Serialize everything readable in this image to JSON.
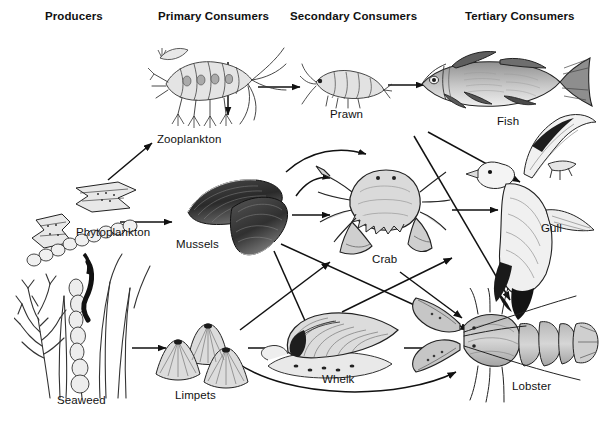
{
  "diagram": {
    "width": 601,
    "height": 433,
    "background_color": "#ffffff",
    "ink_color": "#111111",
    "style": "black and white line engraving illustration"
  },
  "columns": [
    {
      "id": "producers",
      "label": "Producers",
      "x": 45,
      "y": 10
    },
    {
      "id": "primary",
      "label": "Primary Consumers",
      "x": 158,
      "y": 10
    },
    {
      "id": "secondary",
      "label": "Secondary Consumers",
      "x": 290,
      "y": 10
    },
    {
      "id": "tertiary",
      "label": "Tertiary Consumers",
      "x": 465,
      "y": 10
    }
  ],
  "organisms": [
    {
      "id": "phytoplankton",
      "label": "Phytoplankton",
      "trophic_level": "Producers",
      "label_x": 76,
      "label_y": 226,
      "art_x": 18,
      "art_y": 160,
      "art_w": 130,
      "art_h": 110
    },
    {
      "id": "seaweed",
      "label": "Seaweed",
      "trophic_level": "Producers",
      "label_x": 57,
      "label_y": 394,
      "art_x": 16,
      "art_y": 250,
      "art_w": 135,
      "art_h": 150
    },
    {
      "id": "zooplankton",
      "label": "Zooplankton",
      "trophic_level": "Primary Consumers",
      "label_x": 157,
      "label_y": 133,
      "art_x": 150,
      "art_y": 32,
      "art_w": 135,
      "art_h": 100
    },
    {
      "id": "mussels",
      "label": "Mussels",
      "trophic_level": "Primary Consumers",
      "label_x": 176,
      "label_y": 238,
      "art_x": 180,
      "art_y": 168,
      "art_w": 115,
      "art_h": 92
    },
    {
      "id": "limpets",
      "label": "Limpets",
      "trophic_level": "Primary Consumers",
      "label_x": 175,
      "label_y": 389,
      "art_x": 150,
      "art_y": 318,
      "art_w": 105,
      "art_h": 72
    },
    {
      "id": "prawn",
      "label": "Prawn",
      "trophic_level": "Secondary Consumers",
      "label_x": 330,
      "label_y": 108,
      "art_x": 300,
      "art_y": 62,
      "art_w": 90,
      "art_h": 50
    },
    {
      "id": "crab",
      "label": "Crab",
      "trophic_level": "Secondary Consumers",
      "label_x": 372,
      "label_y": 253,
      "art_x": 308,
      "art_y": 155,
      "art_w": 140,
      "art_h": 105
    },
    {
      "id": "whelk",
      "label": "Whelk",
      "trophic_level": "Secondary Consumers",
      "label_x": 322,
      "label_y": 373,
      "art_x": 262,
      "art_y": 312,
      "art_w": 140,
      "art_h": 72
    },
    {
      "id": "fish",
      "label": "Fish",
      "trophic_level": "Tertiary Consumers",
      "label_x": 497,
      "label_y": 115,
      "art_x": 410,
      "art_y": 50,
      "art_w": 180,
      "art_h": 70
    },
    {
      "id": "gull",
      "label": "Gull",
      "trophic_level": "Tertiary Consumers",
      "label_x": 541,
      "label_y": 222,
      "art_x": 468,
      "art_y": 118,
      "art_w": 133,
      "art_h": 200
    },
    {
      "id": "lobster",
      "label": "Lobster",
      "trophic_level": "Tertiary Consumers",
      "label_x": 512,
      "label_y": 380,
      "art_x": 410,
      "art_y": 290,
      "art_w": 190,
      "art_h": 110
    }
  ],
  "feeding_links": [
    {
      "from": "phytoplankton",
      "to": "zooplankton"
    },
    {
      "from": "phytoplankton",
      "to": "mussels"
    },
    {
      "from": "zooplankton",
      "to": "prawn"
    },
    {
      "from": "zooplankton",
      "to": "mussels"
    },
    {
      "from": "prawn",
      "to": "fish"
    },
    {
      "from": "seaweed",
      "to": "limpets"
    },
    {
      "from": "mussels",
      "to": "crab"
    },
    {
      "from": "mussels",
      "to": "whelk"
    },
    {
      "from": "mussels",
      "to": "lobster"
    },
    {
      "from": "limpets",
      "to": "whelk"
    },
    {
      "from": "limpets",
      "to": "crab"
    },
    {
      "from": "limpets",
      "to": "lobster"
    },
    {
      "from": "crab",
      "to": "gull"
    },
    {
      "from": "crab",
      "to": "lobster"
    },
    {
      "from": "whelk",
      "to": "lobster"
    },
    {
      "from": "whelk",
      "to": "gull"
    },
    {
      "from": "fish",
      "to": "gull"
    },
    {
      "from": "fish",
      "to": "lobster"
    },
    {
      "from": "crab",
      "to": "crab-self-loop"
    }
  ]
}
